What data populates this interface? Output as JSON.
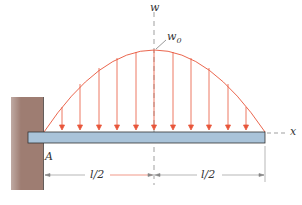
{
  "diagram": {
    "labels": {
      "w_axis": "w",
      "x_axis": "x",
      "peak_load": "w",
      "peak_load_sub": "0",
      "support": "A",
      "left_half": "l/2",
      "right_half": "l/2"
    },
    "colors": {
      "load": "#e8553a",
      "beam_fill": "#a9c3d9",
      "beam_stroke": "#333333",
      "wall": "#9e7d72",
      "dim": "#888888"
    },
    "load_arrows_count": 11
  }
}
